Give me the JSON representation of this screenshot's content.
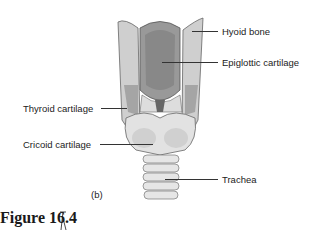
{
  "figure": {
    "caption": "Figure 16.4",
    "panel": "(b)",
    "labels": {
      "hyoid": "Hyoid bone",
      "epiglottic": "Epiglottic cartilage",
      "thyroid": "Thyroid cartilage",
      "cricoid": "Cricoid cartilage",
      "trachea": "Trachea"
    }
  }
}
